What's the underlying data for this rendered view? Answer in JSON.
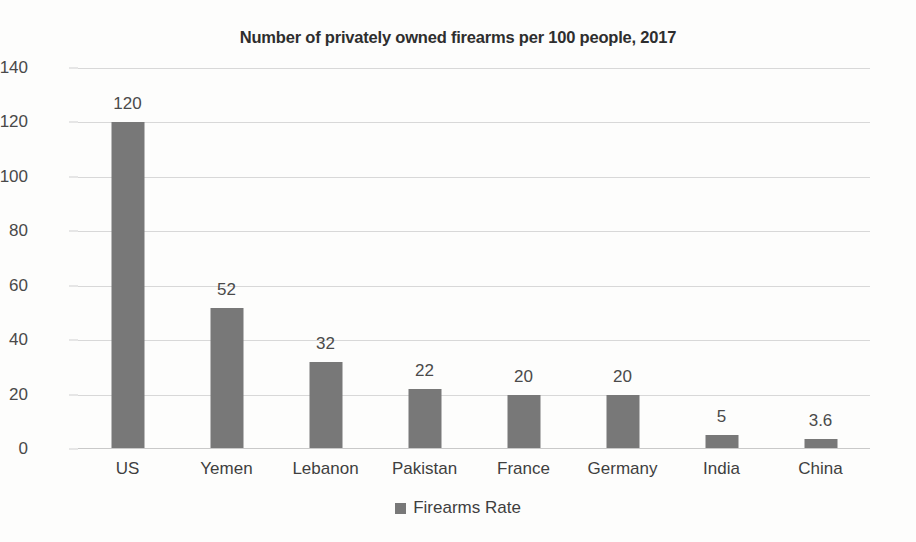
{
  "chart_data": {
    "type": "bar",
    "title": "Number of privately owned firearms per 100 people, 2017",
    "xlabel": "",
    "ylabel": "",
    "categories": [
      "US",
      "Yemen",
      "Lebanon",
      "Pakistan",
      "France",
      "Germany",
      "India",
      "China"
    ],
    "values": [
      120,
      52,
      32,
      22,
      20,
      20,
      5,
      3.6
    ],
    "value_labels": [
      "120",
      "52",
      "32",
      "22",
      "20",
      "20",
      "5",
      "3.6"
    ],
    "series": [
      {
        "name": "Firearms Rate",
        "values": [
          120,
          52,
          32,
          22,
          20,
          20,
          5,
          3.6
        ],
        "color": "#787878"
      }
    ],
    "ylim": [
      0,
      140
    ],
    "ytick_values": [
      0,
      20,
      40,
      60,
      80,
      100,
      120,
      140
    ],
    "ytick_labels": [
      "0",
      "20",
      "40",
      "60",
      "80",
      "100",
      "120",
      "140"
    ],
    "grid": true,
    "grid_color": "#d8d8d8",
    "legend": {
      "position": "bottom",
      "entries": [
        {
          "label": "Firearms Rate",
          "color": "#787878",
          "marker": "square"
        }
      ]
    },
    "background_color": "#fdfdfc",
    "bar_color": "#787878",
    "data_labels_shown": true
  }
}
